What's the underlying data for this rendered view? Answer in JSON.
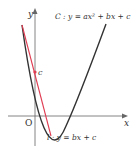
{
  "diagram": {
    "axes": {
      "x_label": "x",
      "y_label": "y",
      "origin_label": "O"
    },
    "curve": {
      "name": "C",
      "equation_label": "C : y = ax² + bx + c",
      "color": "#333333"
    },
    "line": {
      "name": "l",
      "equation_label": "l : y = bx + c",
      "color": "#e03c52"
    },
    "intercept_label": "c",
    "intercept_point_color": "#e03c52"
  }
}
